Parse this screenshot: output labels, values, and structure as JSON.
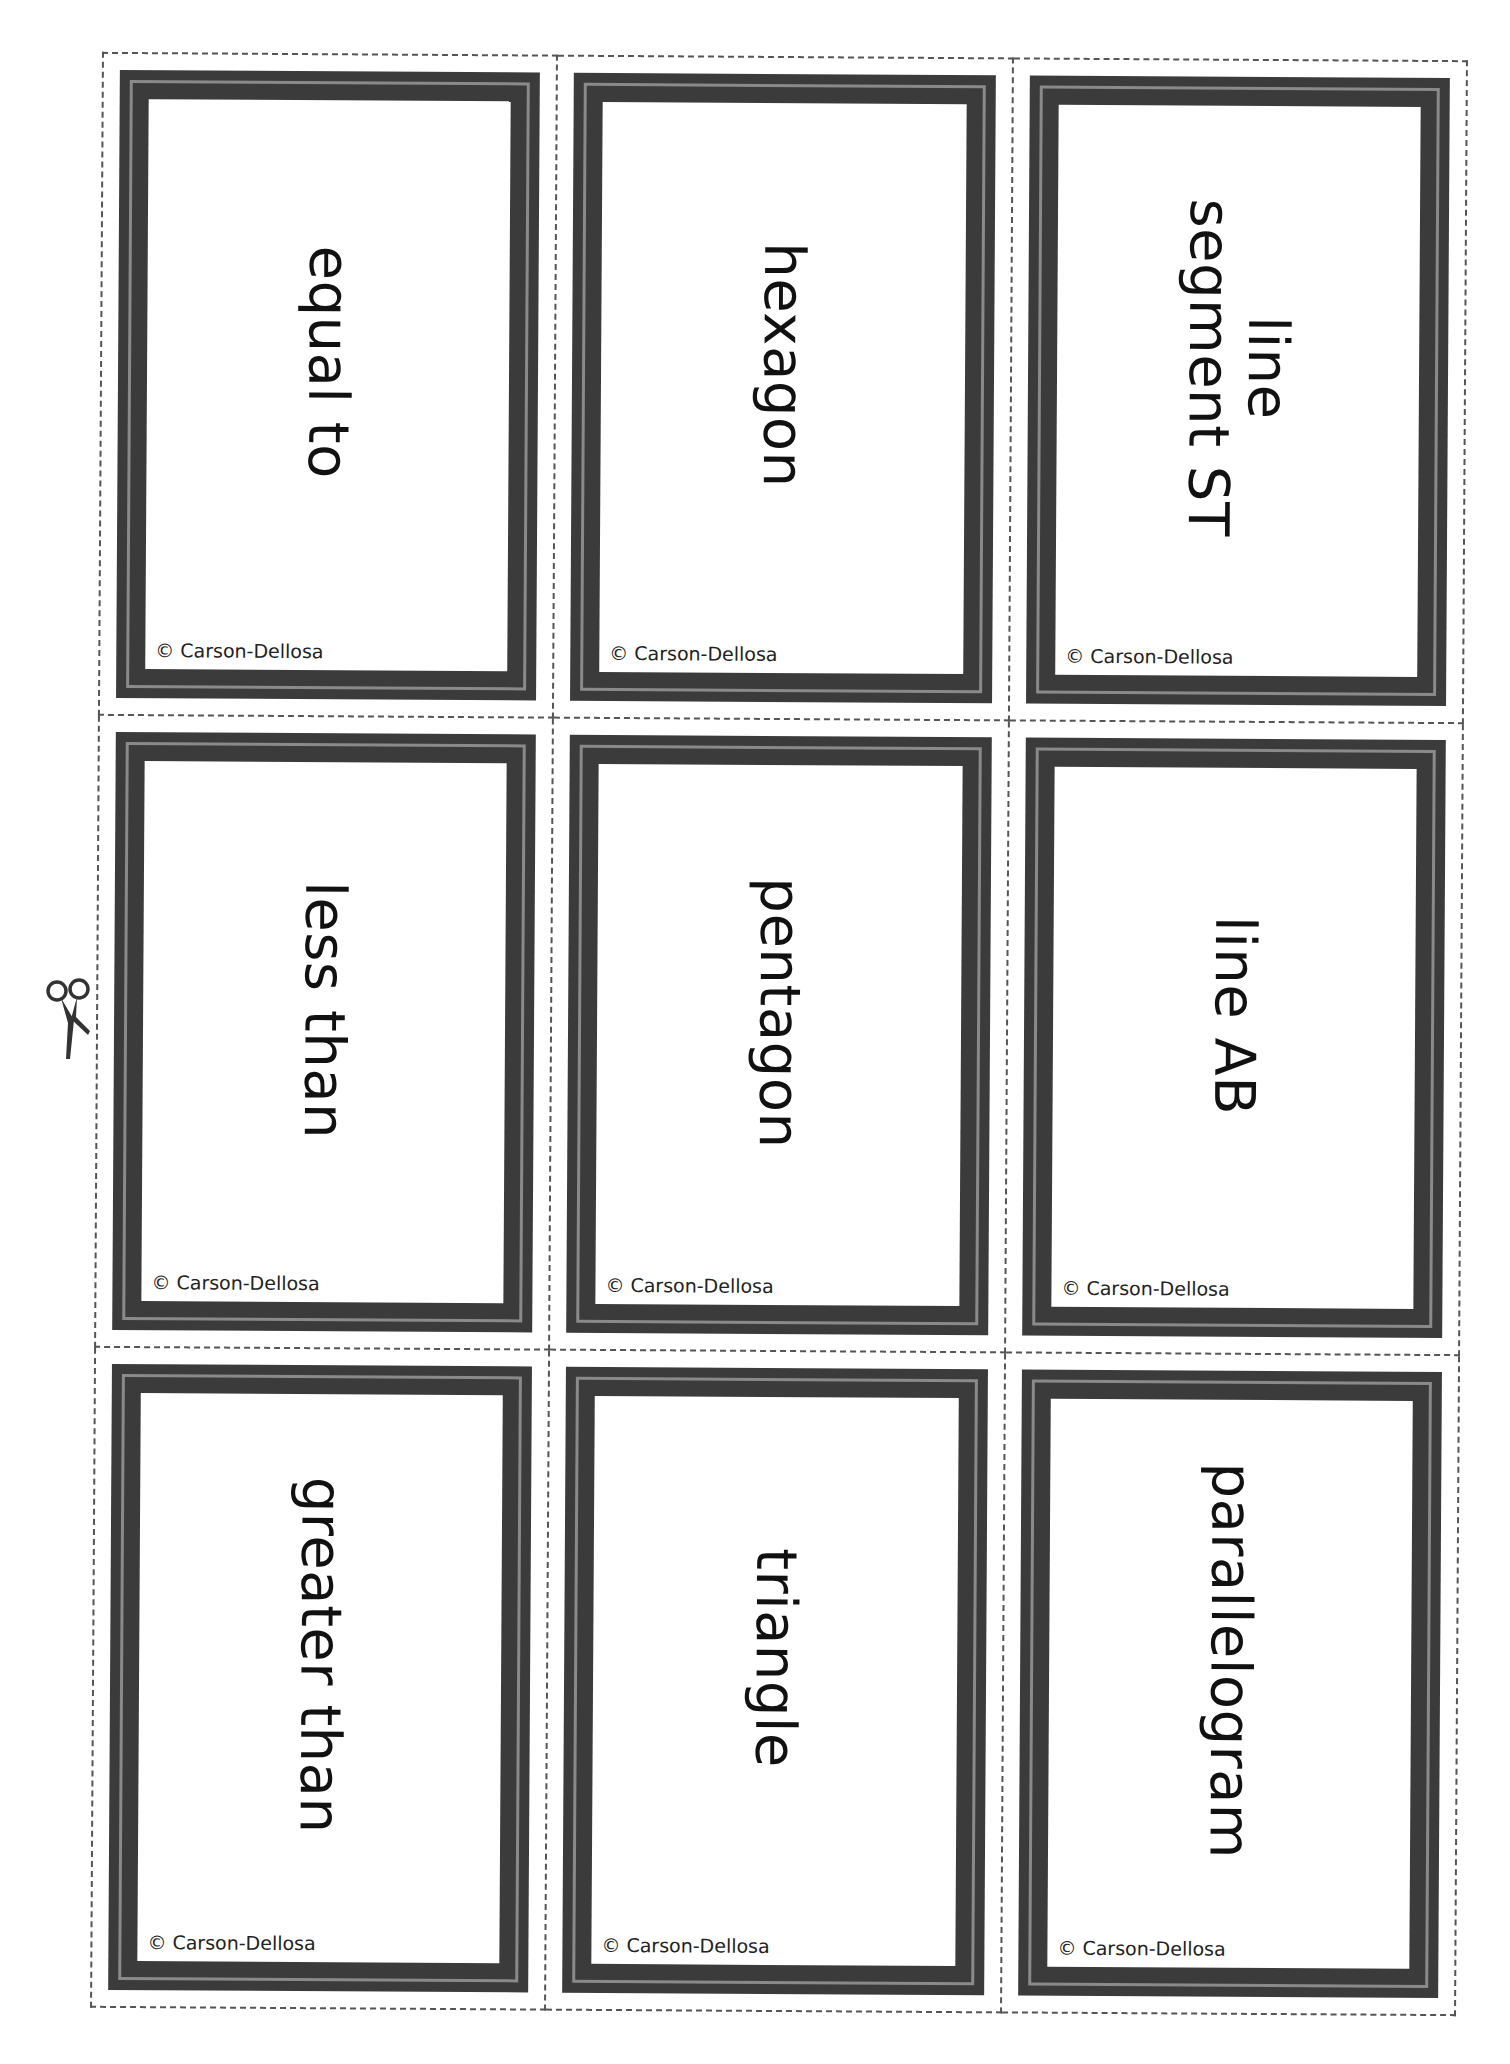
{
  "sheet": {
    "colors": {
      "frame": "#3b3b3b",
      "frame_stripe": "#8a8a8a",
      "card_face": "#ffffff",
      "cut_line": "#555555",
      "text": "#111111"
    },
    "cut_guide_icon": "scissors-icon",
    "cards": [
      {
        "lines": [
          "equal to"
        ],
        "copyright": "© Carson-Dellosa"
      },
      {
        "lines": [
          "hexagon"
        ],
        "copyright": "© Carson-Dellosa"
      },
      {
        "lines": [
          "line",
          "segment ST"
        ],
        "copyright": "© Carson-Dellosa"
      },
      {
        "lines": [
          "less than"
        ],
        "copyright": "© Carson-Dellosa"
      },
      {
        "lines": [
          "pentagon"
        ],
        "copyright": "© Carson-Dellosa"
      },
      {
        "lines": [
          "line AB"
        ],
        "copyright": "© Carson-Dellosa"
      },
      {
        "lines": [
          "greater than"
        ],
        "copyright": "© Carson-Dellosa"
      },
      {
        "lines": [
          "triangle"
        ],
        "copyright": "© Carson-Dellosa"
      },
      {
        "lines": [
          "parallelogram"
        ],
        "copyright": "© Carson-Dellosa"
      }
    ]
  }
}
